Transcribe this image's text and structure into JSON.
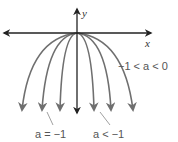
{
  "diagram": {
    "axes": {
      "x_label": "x",
      "y_label": "y"
    },
    "labels": {
      "right": "−1 < a < 0",
      "bottom_left": "a = −1",
      "bottom_right": "a < −1"
    },
    "colors": {
      "curve": "#6f6f6f",
      "axis": "#222222"
    },
    "curves": [
      {
        "end_x": 22,
        "group": "-1<a<0"
      },
      {
        "end_x": 42,
        "group": "a=-1"
      },
      {
        "end_x": 60,
        "group": "a<-1"
      },
      {
        "end_x": 94,
        "group": "a<-1"
      },
      {
        "end_x": 111,
        "group": "a=-1"
      },
      {
        "end_x": 133,
        "group": "-1<a<0"
      }
    ]
  }
}
